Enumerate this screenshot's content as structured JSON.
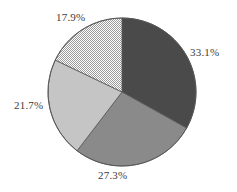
{
  "chart_data": {
    "type": "pie",
    "title": "",
    "subtitle": "",
    "xlabel": "",
    "ylabel": "",
    "legend": "none",
    "grid": false,
    "label_format": "percent",
    "start_angle_deg": 0,
    "direction": "clockwise",
    "categories": [
      "Slice 1",
      "Slice 2",
      "Slice 3",
      "Slice 4"
    ],
    "values": [
      33.1,
      27.3,
      21.7,
      17.9
    ],
    "labels": [
      "33.1%",
      "27.3%",
      "21.7%",
      "17.9%"
    ],
    "slices": [
      {
        "label": "33.1%",
        "value": 33.1,
        "fill": "#4a4a4a",
        "fill_style": "solid",
        "start_deg": 0.0,
        "end_deg": 119.2
      },
      {
        "label": "27.3%",
        "value": 27.3,
        "fill": "#8a8a8a",
        "fill_style": "solid",
        "start_deg": 119.2,
        "end_deg": 217.4
      },
      {
        "label": "21.7%",
        "value": 21.7,
        "fill": "#c5c5c5",
        "fill_style": "solid",
        "start_deg": 217.4,
        "end_deg": 295.6
      },
      {
        "label": "17.9%",
        "value": 17.9,
        "fill": "#d0d0d0",
        "fill_style": "stipple",
        "start_deg": 295.6,
        "end_deg": 360.0
      }
    ],
    "geometry": {
      "center_x": 122,
      "center_y": 92,
      "radius": 74
    },
    "colors": {
      "outline": "#555555",
      "label_text": "#3d3d3d",
      "background": "#ffffff"
    }
  }
}
